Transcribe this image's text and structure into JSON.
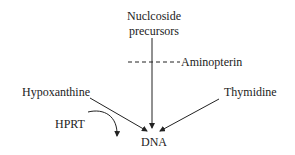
{
  "diagram": {
    "nodes": {
      "precursors_line1": "Nuclcoside",
      "precursors_line2": "precursors",
      "inhibitor": "Aminopterin",
      "hypoxanthine": "Hypoxanthine",
      "thymidine": "Thymidine",
      "enzyme": "HPRT",
      "product": "DNA"
    },
    "edges": [
      {
        "from": "Nuclcoside precursors",
        "to": "DNA",
        "style": "solid-arrow"
      },
      {
        "from": "Hypoxanthine",
        "to": "DNA",
        "style": "solid-arrow"
      },
      {
        "from": "Thymidine",
        "to": "DNA",
        "style": "solid-arrow"
      },
      {
        "from": "Aminopterin",
        "to": "Nuclcoside precursors pathway",
        "style": "dashed-block"
      },
      {
        "from": "HPRT",
        "to": "Hypoxanthine conversion",
        "style": "curved-arrow"
      }
    ],
    "colors": {
      "line": "#222222",
      "background": "#ffffff"
    }
  }
}
